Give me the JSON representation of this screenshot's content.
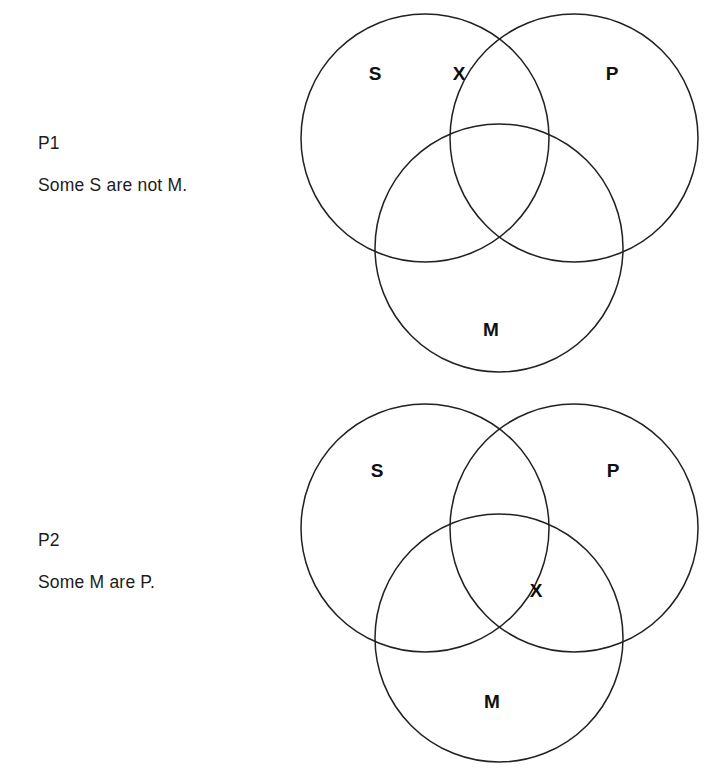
{
  "page": {
    "background_color": "#ffffff",
    "ink_color": "#23211f",
    "width": 719,
    "height": 780
  },
  "premises": [
    {
      "tag": "P1",
      "statement": "Some S are not M."
    },
    {
      "tag": "P2",
      "statement": "Some M are P."
    }
  ],
  "diagrams": [
    {
      "id": "venn-p1",
      "circles": [
        {
          "name": "S",
          "label": "S",
          "cx": 145,
          "cy": 138,
          "r": 124,
          "label_x": 95,
          "label_y": 75
        },
        {
          "name": "P",
          "label": "P",
          "cx": 294,
          "cy": 138,
          "r": 124,
          "label_x": 332,
          "label_y": 75
        },
        {
          "name": "M",
          "label": "M",
          "cx": 219,
          "cy": 248,
          "r": 124,
          "label_x": 211,
          "label_y": 331
        }
      ],
      "marks": [
        {
          "symbol": "X",
          "region": "S-and-P-not-M",
          "x": 179,
          "y": 75,
          "description": "X placed in the S and P overlap outside M"
        }
      ]
    },
    {
      "id": "venn-p2",
      "circles": [
        {
          "name": "S",
          "label": "S",
          "cx": 145,
          "cy": 138,
          "r": 124,
          "label_x": 97,
          "label_y": 82
        },
        {
          "name": "P",
          "label": "P",
          "cx": 294,
          "cy": 138,
          "r": 124,
          "label_x": 333,
          "label_y": 82
        },
        {
          "name": "M",
          "label": "M",
          "cx": 219,
          "cy": 248,
          "r": 124,
          "label_x": 212,
          "label_y": 313
        }
      ],
      "marks": [
        {
          "symbol": "X",
          "region": "M-and-P-on-S-boundary",
          "x": 256,
          "y": 202,
          "description": "X straddling the S circle boundary within the M and P overlap"
        }
      ]
    }
  ]
}
